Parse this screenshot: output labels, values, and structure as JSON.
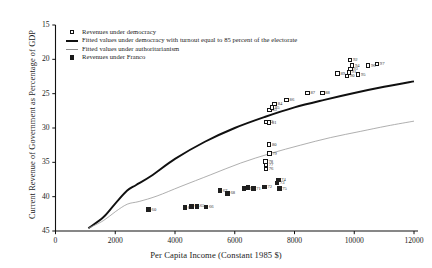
{
  "page_artifact_text": "",
  "axes": {
    "xlabel": "Per Capita Income (Constant 1985 $)",
    "ylabel": "Current Revenue of Government as Percentage of GDP",
    "xticks": [
      "0",
      "2000",
      "4000",
      "6000",
      "8000",
      "10000",
      "12000"
    ],
    "yticks": [
      "45",
      "40",
      "35",
      "30",
      "25",
      "20",
      "15"
    ]
  },
  "legend": {
    "items": [
      {
        "key": "open-square",
        "label": "Revenues under democracy"
      },
      {
        "key": "thick-line",
        "label": "Fitted values under democracy with turnout equal to 85 percent of the electorate"
      },
      {
        "key": "thin-line",
        "label": "Fitted values under authoritarianism"
      },
      {
        "key": "filled-square",
        "label": "Revenues under Franco"
      }
    ]
  },
  "chart_data": {
    "type": "scatter",
    "title": "",
    "xlabel": "Per Capita Income (Constant 1985 $)",
    "ylabel": "Current Revenue of Government as Percentage of GDP",
    "xlim": [
      0,
      12000
    ],
    "ylim": [
      15,
      45
    ],
    "xticks": [
      0,
      2000,
      4000,
      6000,
      8000,
      10000,
      12000
    ],
    "yticks": [
      15,
      20,
      25,
      30,
      35,
      40,
      45
    ],
    "grid": false,
    "legend_position": "top-left-inside",
    "series": [
      {
        "name": "Revenues under democracy",
        "marker": "open-square",
        "points": [
          {
            "label": "79",
            "x": 7160,
            "y": 26.3
          },
          {
            "label": "80",
            "x": 7150,
            "y": 27.6
          },
          {
            "label": "82",
            "x": 7040,
            "y": 30.9
          },
          {
            "label": "81",
            "x": 7150,
            "y": 30.8
          },
          {
            "label": "83",
            "x": 7160,
            "y": 32.6
          },
          {
            "label": "85",
            "x": 7250,
            "y": 33.0
          },
          {
            "label": "84",
            "x": 7340,
            "y": 33.5
          },
          {
            "label": "86",
            "x": 7740,
            "y": 34.1
          },
          {
            "label": "87",
            "x": 8440,
            "y": 35.1
          },
          {
            "label": "88",
            "x": 8930,
            "y": 35.1
          },
          {
            "label": "89",
            "x": 9440,
            "y": 37.9
          },
          {
            "label": "90",
            "x": 9760,
            "y": 37.6
          },
          {
            "label": "91",
            "x": 9820,
            "y": 38.1
          },
          {
            "label": "92",
            "x": 9860,
            "y": 39.9
          },
          {
            "label": "93",
            "x": 9870,
            "y": 38.6
          },
          {
            "label": "94",
            "x": 9930,
            "y": 39.1
          },
          {
            "label": "95",
            "x": 10130,
            "y": 37.8
          },
          {
            "label": "96",
            "x": 10460,
            "y": 39.1
          },
          {
            "label": "97",
            "x": 10760,
            "y": 39.3
          },
          {
            "label": "76",
            "x": 7040,
            "y": 24.0
          },
          {
            "label": "77",
            "x": 7040,
            "y": 24.6
          },
          {
            "label": "78",
            "x": 7030,
            "y": 25.1
          }
        ]
      },
      {
        "name": "Revenues under Franco",
        "marker": "filled-square",
        "points": [
          {
            "label": "60",
            "x": 3120,
            "y": 18.1
          },
          {
            "label": "63",
            "x": 4330,
            "y": 18.4
          },
          {
            "label": "64",
            "x": 4560,
            "y": 18.6
          },
          {
            "label": "65",
            "x": 4740,
            "y": 18.6
          },
          {
            "label": "66",
            "x": 5040,
            "y": 18.5
          },
          {
            "label": "67",
            "x": 5500,
            "y": 20.9
          },
          {
            "label": "68",
            "x": 5760,
            "y": 20.5
          },
          {
            "label": "69",
            "x": 6310,
            "y": 21.2
          },
          {
            "label": "70",
            "x": 6440,
            "y": 21.3
          },
          {
            "label": "71",
            "x": 6620,
            "y": 21.2
          },
          {
            "label": "72",
            "x": 7000,
            "y": 21.4
          },
          {
            "label": "73",
            "x": 7420,
            "y": 22.0
          },
          {
            "label": "74",
            "x": 7460,
            "y": 22.4
          },
          {
            "label": "75",
            "x": 7490,
            "y": 21.2
          }
        ]
      }
    ],
    "curves": [
      {
        "name": "Fitted values under democracy with turnout equal to 85 percent of the electorate",
        "style": "thick-black",
        "points": [
          {
            "x": 1100,
            "y": 15.4
          },
          {
            "x": 1600,
            "y": 17.0
          },
          {
            "x": 2000,
            "y": 19.0
          },
          {
            "x": 2400,
            "y": 20.9
          },
          {
            "x": 2700,
            "y": 21.7
          },
          {
            "x": 3200,
            "y": 23.0
          },
          {
            "x": 4000,
            "y": 25.5
          },
          {
            "x": 5000,
            "y": 28.0
          },
          {
            "x": 6000,
            "y": 30.0
          },
          {
            "x": 7000,
            "y": 31.6
          },
          {
            "x": 8000,
            "y": 33.0
          },
          {
            "x": 9000,
            "y": 34.1
          },
          {
            "x": 10000,
            "y": 35.1
          },
          {
            "x": 11000,
            "y": 36.0
          },
          {
            "x": 12000,
            "y": 36.8
          }
        ]
      },
      {
        "name": "Fitted values under authoritarianism",
        "style": "thin-gray",
        "points": [
          {
            "x": 1100,
            "y": 15.4
          },
          {
            "x": 1600,
            "y": 16.5
          },
          {
            "x": 2000,
            "y": 17.8
          },
          {
            "x": 2400,
            "y": 18.9
          },
          {
            "x": 2800,
            "y": 19.3
          },
          {
            "x": 3400,
            "y": 20.1
          },
          {
            "x": 4200,
            "y": 21.5
          },
          {
            "x": 5200,
            "y": 23.2
          },
          {
            "x": 6200,
            "y": 24.9
          },
          {
            "x": 7200,
            "y": 26.3
          },
          {
            "x": 8200,
            "y": 27.5
          },
          {
            "x": 9200,
            "y": 28.6
          },
          {
            "x": 10200,
            "y": 29.5
          },
          {
            "x": 11100,
            "y": 30.3
          },
          {
            "x": 12000,
            "y": 31.0
          }
        ]
      }
    ]
  }
}
